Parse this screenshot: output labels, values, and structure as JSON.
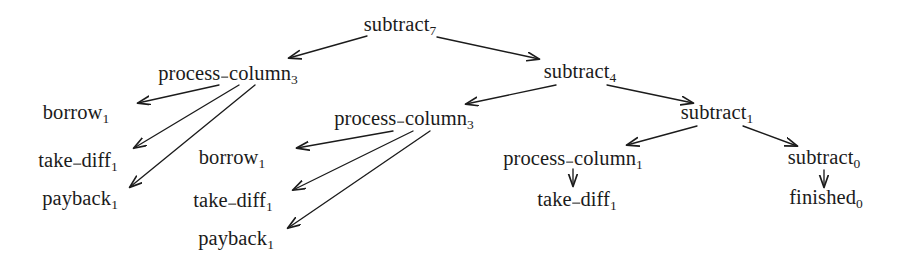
{
  "figure": {
    "background_color": "#ffffff",
    "ink_color": "#1b1b1b",
    "width": 907,
    "height": 272
  },
  "chart_data": {
    "type": "diagram",
    "diagram_kind": "tree",
    "title": "",
    "layout_hint": "top-down call/derivation tree with labelled nodes and straight arrow edges",
    "nodes": [
      {
        "id": "n0",
        "name": "subtract",
        "subscript": "7",
        "label": "subtract7",
        "x": 400,
        "y": 26,
        "depth": 0
      },
      {
        "id": "n1",
        "name": "process_column",
        "subscript": "3",
        "label": "process_column3",
        "x": 228,
        "y": 73,
        "depth": 1
      },
      {
        "id": "n2",
        "name": "subtract",
        "subscript": "4",
        "label": "subtract4",
        "x": 580,
        "y": 73,
        "depth": 1
      },
      {
        "id": "n3",
        "name": "borrow",
        "subscript": "1",
        "label": "borrow1",
        "x": 76,
        "y": 114,
        "depth": 2
      },
      {
        "id": "n4",
        "name": "take_diff",
        "subscript": "1",
        "label": "take_diff1",
        "x": 78,
        "y": 160,
        "depth": 2
      },
      {
        "id": "n5",
        "name": "payback",
        "subscript": "1",
        "label": "payback1",
        "x": 80,
        "y": 200,
        "depth": 2
      },
      {
        "id": "n6",
        "name": "process_column",
        "subscript": "3",
        "label": "process_column3",
        "x": 404,
        "y": 118,
        "depth": 2
      },
      {
        "id": "n7",
        "name": "subtract",
        "subscript": "1",
        "label": "subtract1",
        "x": 717,
        "y": 114,
        "depth": 2
      },
      {
        "id": "n8",
        "name": "borrow",
        "subscript": "1",
        "label": "borrow1",
        "x": 232,
        "y": 159,
        "depth": 3
      },
      {
        "id": "n9",
        "name": "take_diff",
        "subscript": "1",
        "label": "take_diff1",
        "x": 233,
        "y": 200,
        "depth": 3
      },
      {
        "id": "n10",
        "name": "payback",
        "subscript": "1",
        "label": "payback1",
        "x": 236,
        "y": 240,
        "depth": 3
      },
      {
        "id": "n11",
        "name": "process_column",
        "subscript": "1",
        "label": "process_column1",
        "x": 573,
        "y": 158,
        "depth": 3
      },
      {
        "id": "n12",
        "name": "take_diff",
        "subscript": "1",
        "label": "take_diff1",
        "x": 577,
        "y": 199,
        "depth": 4
      },
      {
        "id": "n13",
        "name": "subtract",
        "subscript": "0",
        "label": "subtract0",
        "x": 824,
        "y": 159,
        "depth": 3
      },
      {
        "id": "n14",
        "name": "finished",
        "subscript": "0",
        "label": "finished0",
        "x": 826,
        "y": 199,
        "depth": 4
      }
    ],
    "edges": [
      {
        "from": "n0",
        "to": "n1",
        "x1": 367,
        "y1": 36,
        "x2": 289,
        "y2": 58
      },
      {
        "from": "n0",
        "to": "n2",
        "x1": 437,
        "y1": 37,
        "x2": 539,
        "y2": 59
      },
      {
        "from": "n1",
        "to": "n3",
        "x1": 219,
        "y1": 85,
        "x2": 138,
        "y2": 103
      },
      {
        "from": "n1",
        "to": "n4",
        "x1": 239,
        "y1": 85,
        "x2": 134,
        "y2": 148
      },
      {
        "from": "n1",
        "to": "n5",
        "x1": 255,
        "y1": 85,
        "x2": 130,
        "y2": 187
      },
      {
        "from": "n2",
        "to": "n6",
        "x1": 556,
        "y1": 85,
        "x2": 466,
        "y2": 104
      },
      {
        "from": "n2",
        "to": "n7",
        "x1": 607,
        "y1": 85,
        "x2": 693,
        "y2": 103
      },
      {
        "from": "n6",
        "to": "n8",
        "x1": 393,
        "y1": 131,
        "x2": 297,
        "y2": 148
      },
      {
        "from": "n6",
        "to": "n9",
        "x1": 413,
        "y1": 131,
        "x2": 293,
        "y2": 190
      },
      {
        "from": "n6",
        "to": "n10",
        "x1": 430,
        "y1": 131,
        "x2": 288,
        "y2": 228
      },
      {
        "from": "n7",
        "to": "n11",
        "x1": 697,
        "y1": 126,
        "x2": 627,
        "y2": 145
      },
      {
        "from": "n7",
        "to": "n13",
        "x1": 743,
        "y1": 126,
        "x2": 797,
        "y2": 146
      },
      {
        "from": "n11",
        "to": "n12",
        "x1": 573,
        "y1": 169,
        "x2": 573,
        "y2": 186
      },
      {
        "from": "n13",
        "to": "n14",
        "x1": 824,
        "y1": 170,
        "x2": 824,
        "y2": 187
      }
    ],
    "node_count": 15,
    "edge_count": 14
  }
}
